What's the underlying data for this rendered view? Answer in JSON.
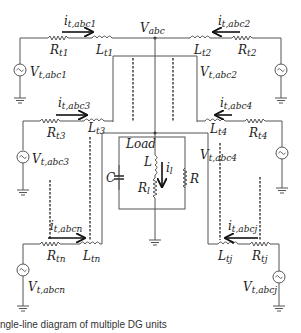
{
  "figure": {
    "caption": "ngle-line diagram of multiple DG units",
    "bus_label": "V_abc",
    "bus_label_main": "V",
    "bus_label_sub": "abc"
  },
  "units": [
    {
      "id": "1",
      "current_main": "i",
      "current_sub": "t,abc1",
      "r_main": "R",
      "r_sub": "t1",
      "l_main": "L",
      "l_sub": "t1",
      "v_main": "V",
      "v_sub": "t,abc1",
      "side": "left"
    },
    {
      "id": "2",
      "current_main": "i",
      "current_sub": "t,abc2",
      "r_main": "R",
      "r_sub": "t2",
      "l_main": "L",
      "l_sub": "t2",
      "v_main": "V",
      "v_sub": "t,abc2",
      "side": "right"
    },
    {
      "id": "3",
      "current_main": "i",
      "current_sub": "t,abc3",
      "r_main": "R",
      "r_sub": "t3",
      "l_main": "L",
      "l_sub": "t3",
      "v_main": "V",
      "v_sub": "t,abc3",
      "side": "left"
    },
    {
      "id": "4",
      "current_main": "i",
      "current_sub": "t,abc4",
      "r_main": "R",
      "r_sub": "t4",
      "l_main": "L",
      "l_sub": "t4",
      "v_main": "V",
      "v_sub": "t,abc4",
      "side": "right"
    },
    {
      "id": "n",
      "current_main": "i",
      "current_sub": "t,abcn",
      "r_main": "R",
      "r_sub": "tn",
      "l_main": "L",
      "l_sub": "tn",
      "v_main": "V",
      "v_sub": "t,abcn",
      "side": "left"
    },
    {
      "id": "j",
      "current_main": "i",
      "current_sub": "t,abcj",
      "r_main": "R",
      "r_sub": "tj",
      "l_main": "L",
      "l_sub": "tj",
      "v_main": "V",
      "v_sub": "t,abcj",
      "side": "right"
    }
  ],
  "load": {
    "title": "Load",
    "capacitor": "C",
    "inductor": "L",
    "resistor_series_main": "R",
    "resistor_series_sub": "l",
    "resistor_parallel": "R",
    "current_main": "i",
    "current_sub": "l"
  }
}
